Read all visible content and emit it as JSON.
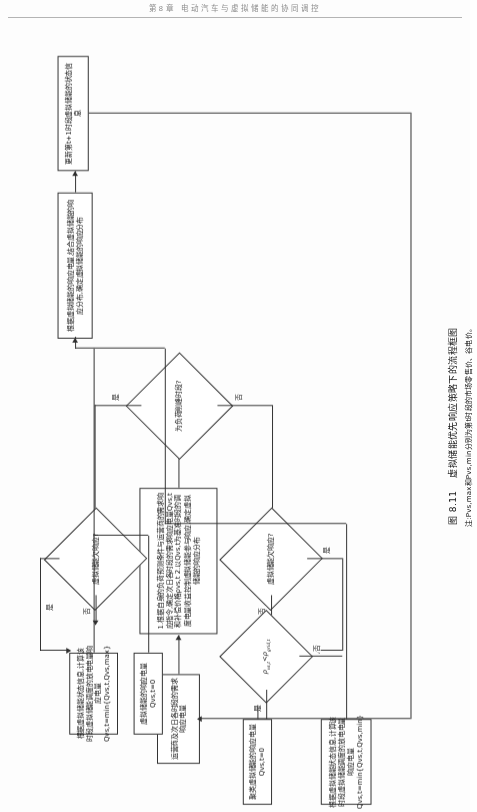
{
  "page": {
    "running_head": "第8章 电动汽车与虚拟储能的协同调控",
    "figure_number": "图 8.11",
    "figure_title": "虚拟储能优先响应策略下的流程框图",
    "figure_note": "注:Pvs,max和Pvs,min分别为第t时段的市场零售价、谷电价。"
  },
  "flowchart": {
    "type": "flowchart",
    "nodes": [
      {
        "id": "n1",
        "kind": "process",
        "text": "运营商及次日各时段的需求响应电量",
        "lines": [
          "运营商及次日各时段",
          "的需求响应电量"
        ]
      },
      {
        "id": "n2",
        "kind": "process",
        "text": "1.根据自身的负荷预测条件与运营商的需求响应指令,确定次日各时段的需求响应电量Qvs,t和补偿价格ρvs,t  2.以Qvs,t为基准时段的调度电量收益控制虚拟储能参与响应,确定虚拟储能的响应分布",
        "lines": [
          "1.根据自身的负荷预测条件与运营商的需求响应指令,确",
          "定次日各时段的需求响应电量Qvs,t和补偿价格ρvs,t",
          "2.以Qvs,t为基准时段的调度电量收益控制虚拟",
          "储能参与响应,确定虚拟储能的响应分布"
        ]
      },
      {
        "id": "d1",
        "kind": "decision",
        "text": "为负荷削峰时段?"
      },
      {
        "id": "d2",
        "kind": "decision",
        "text": "虚拟储能欠响应?"
      },
      {
        "id": "d3",
        "kind": "decision",
        "text": "虚拟储能欠响应?"
      },
      {
        "id": "d4",
        "kind": "decision",
        "text": "ρvs,t < ρgrid,t",
        "lines": [
          "ρ",
          "vs,t",
          " ",
          "ρ",
          "grid,t"
        ]
      },
      {
        "id": "n3",
        "kind": "process",
        "text": "根据虚拟储能状态信息,计算该时段虚拟储能调度的放电电量响应电量Qvs,t=min{Qvs,t,Qvs,max}",
        "lines": [
          "根据虚拟储能状态信息,计算该时段虚拟储能调",
          "度的放电电量响应电量Qvs,t=min{Qvs,t-Qvs,max}"
        ]
      },
      {
        "id": "n4",
        "kind": "process",
        "text": "根据虚拟储能状态信息,计算该时段虚拟储能调度的放电电量响应电量Qvs,t=min{Qvs,t,Qvs,min}",
        "lines": [
          "根据虚拟储能状态信息,计算该时段虚拟储能调",
          "度的放电电量响应电量Qvs,t=min{Qvs,min-Qvs,t}"
        ]
      },
      {
        "id": "n5",
        "kind": "process",
        "text": "虚拟储能的响应电量Qvs,t=0",
        "lines": [
          "虚拟储能的响应电量Qvs,t=0"
        ]
      },
      {
        "id": "n6",
        "kind": "process",
        "text": "聚类虚拟储能的响应电量Qvs,t=0",
        "lines": [
          "聚类虚拟储能的响应电量Qvs,t=0"
        ]
      },
      {
        "id": "n7",
        "kind": "process",
        "text": "根据虚拟储能的响应电量,结合虚拟储能的响应分布,确定虚拟储能的响应分布",
        "lines": [
          "根据虚拟储能响应电量,结合虚拟储能的响应",
          "分布,确定t+1虚拟储能的响应分布"
        ]
      },
      {
        "id": "n8",
        "kind": "process",
        "text": "更新第t+1时段虚拟储能的状态信息",
        "lines": [
          "更新第t+1时段虚拟储能的状态信息"
        ]
      }
    ],
    "edge_labels": {
      "yes": "是",
      "no": "否"
    }
  }
}
